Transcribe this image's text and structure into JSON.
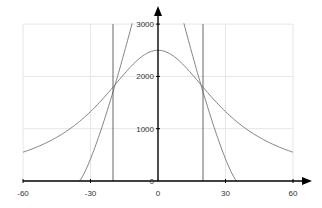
{
  "chart_data": {
    "type": "line",
    "title": "",
    "xlabel": "",
    "ylabel": "",
    "xlim": [
      -60,
      60
    ],
    "ylim": [
      0,
      3000
    ],
    "grid": true,
    "legend": "none",
    "x_ticks": [
      "-60",
      "-30",
      "0",
      "30",
      "60"
    ],
    "y_ticks": [
      "0",
      "1000",
      "2000",
      "3000"
    ],
    "series": [
      {
        "name": "bell-curve",
        "description": "smooth peak ~2500 at x=0, ~550 at x=±60",
        "x": [
          -60,
          -50,
          -40,
          -30,
          -20,
          -10,
          0,
          10,
          20,
          30,
          40,
          50,
          60
        ],
        "values": [
          550,
          726,
          970,
          1330,
          1795,
          2275,
          2500,
          2275,
          1795,
          1330,
          970,
          726,
          550
        ]
      },
      {
        "name": "steep-curve",
        "description": "zero at x=±35, ~1700 at x=±20, exceeds 3000 near x=±11.5",
        "x": [
          -35,
          -30,
          -25,
          -20,
          -15,
          -11.5,
          11.5,
          15,
          20,
          25,
          30,
          35
        ],
        "values": [
          0,
          420,
          1020,
          1700,
          2440,
          3000,
          3000,
          2440,
          1700,
          1020,
          420,
          0
        ]
      },
      {
        "name": "vertical-line-left",
        "x": [
          -20,
          -20
        ],
        "values": [
          0,
          3000
        ]
      },
      {
        "name": "vertical-line-right",
        "x": [
          20,
          20
        ],
        "values": [
          0,
          3000
        ]
      }
    ]
  },
  "colors": {
    "axis": "#000000",
    "grid": "#e6e6e6",
    "curve": "#777777",
    "vline": "#555555"
  }
}
